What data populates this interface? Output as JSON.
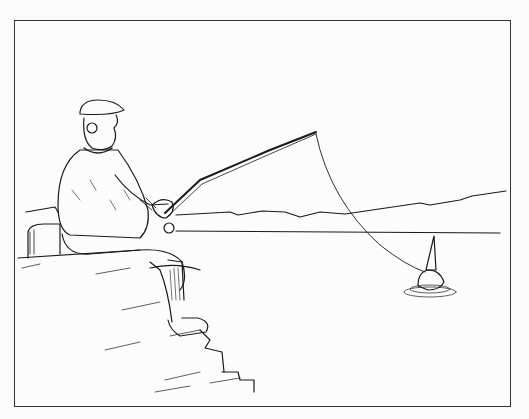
{
  "illustration": {
    "subject": "Man in cap and sweater sitting on rocky steps, fishing with rod; line hooked to a horned creature in the water",
    "colors": {
      "ink": "#1a1a1a",
      "paper": "#fcfcfc",
      "frame": "#333333"
    }
  }
}
